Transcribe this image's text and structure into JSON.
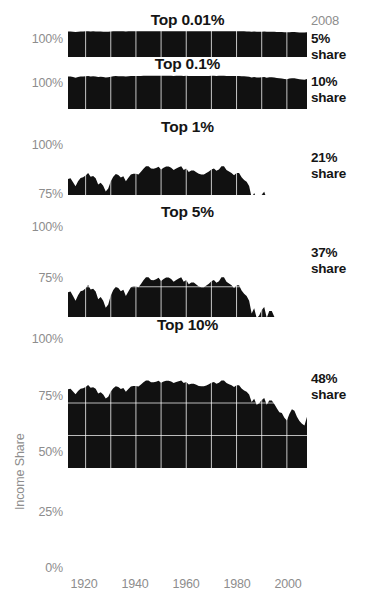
{
  "figure": {
    "y_axis_title": "Income Share",
    "end_year_label": "2008",
    "background_color": "#ffffff",
    "series_color": "#111111",
    "tick_color": "#8d8d8d",
    "gridline_color": "#ffffff"
  },
  "chart_data": {
    "type": "area",
    "title": "Income Share",
    "xlabel": "",
    "ylabel": "Income Share",
    "grid": true,
    "legend_position": "none",
    "x": [
      1913,
      1914,
      1915,
      1916,
      1917,
      1918,
      1919,
      1920,
      1921,
      1922,
      1923,
      1924,
      1925,
      1926,
      1927,
      1928,
      1929,
      1930,
      1931,
      1932,
      1933,
      1934,
      1935,
      1936,
      1937,
      1938,
      1939,
      1940,
      1941,
      1942,
      1943,
      1944,
      1945,
      1946,
      1947,
      1948,
      1949,
      1950,
      1951,
      1952,
      1953,
      1954,
      1955,
      1956,
      1957,
      1958,
      1959,
      1960,
      1961,
      1962,
      1963,
      1964,
      1965,
      1966,
      1967,
      1968,
      1969,
      1970,
      1971,
      1972,
      1973,
      1974,
      1975,
      1976,
      1977,
      1978,
      1979,
      1980,
      1981,
      1982,
      1983,
      1984,
      1985,
      1986,
      1987,
      1988,
      1989,
      1990,
      1991,
      1992,
      1993,
      1994,
      1995,
      1996,
      1997,
      1998,
      1999,
      2000,
      2001,
      2002,
      2003,
      2004,
      2005,
      2006,
      2007,
      2008
    ],
    "xlim": [
      1913,
      2008
    ],
    "xticks": [
      1920,
      1940,
      1960,
      1980,
      2000
    ],
    "xticklabels": [
      "1920",
      "1940",
      "1960",
      "1980",
      "2000"
    ],
    "panels": [
      {
        "name": "Top 0.01%",
        "title": "Top 0.01%",
        "end_value_label": "5%",
        "end_value_sublabel": "share",
        "ylim": [
          0,
          100
        ],
        "yticks": [
          100
        ],
        "yticklabels": [
          "100%"
        ],
        "values": [
          98.2,
          98.4,
          97.3,
          96.0,
          97.2,
          98.1,
          98.4,
          98.6,
          98.9,
          98.4,
          98.6,
          98.4,
          97.6,
          97.8,
          97.5,
          96.8,
          97.2,
          98.0,
          98.6,
          98.9,
          98.8,
          98.6,
          98.7,
          98.3,
          98.6,
          98.9,
          98.9,
          98.9,
          98.9,
          99.1,
          99.3,
          99.4,
          99.4,
          99.3,
          99.3,
          99.3,
          99.4,
          99.2,
          99.3,
          99.4,
          99.4,
          99.3,
          99.2,
          99.3,
          99.4,
          99.4,
          99.2,
          99.3,
          99.1,
          99.2,
          99.2,
          99.1,
          99.0,
          99.0,
          99.0,
          99.1,
          99.2,
          99.3,
          99.3,
          99.2,
          99.3,
          99.4,
          99.4,
          99.2,
          99.1,
          99.0,
          98.9,
          99.0,
          99.0,
          98.8,
          98.6,
          98.5,
          98.2,
          97.2,
          97.6,
          96.9,
          97.1,
          97.5,
          97.7,
          96.9,
          97.4,
          97.4,
          97.0,
          96.4,
          95.9,
          95.8,
          95.2,
          94.8,
          95.6,
          96.2,
          96.0,
          95.2,
          94.6,
          94.2,
          94.0,
          95.0
        ]
      },
      {
        "name": "Top 0.1%",
        "title": "Top 0.1%",
        "end_value_label": "10%",
        "end_value_sublabel": "share",
        "ylim": [
          0,
          100
        ],
        "yticks": [
          100
        ],
        "yticklabels": [
          "100%"
        ],
        "values": [
          95.6,
          95.8,
          94.0,
          92.2,
          94.1,
          95.3,
          95.7,
          96.2,
          96.9,
          95.9,
          96.2,
          95.8,
          94.2,
          94.6,
          93.9,
          92.3,
          93.2,
          95.0,
          96.2,
          96.8,
          96.6,
          96.1,
          96.4,
          95.3,
          96.1,
          96.8,
          96.9,
          96.9,
          96.8,
          97.2,
          97.6,
          97.9,
          97.9,
          97.6,
          97.6,
          97.7,
          97.9,
          97.5,
          97.7,
          97.9,
          97.9,
          97.7,
          97.4,
          97.6,
          97.8,
          97.9,
          97.4,
          97.6,
          97.1,
          97.3,
          97.3,
          97.1,
          96.9,
          96.8,
          96.8,
          97.0,
          97.2,
          97.5,
          97.6,
          97.3,
          97.5,
          97.9,
          97.9,
          97.4,
          97.2,
          97.0,
          96.7,
          97.0,
          97.0,
          96.4,
          96.0,
          95.7,
          95.0,
          93.0,
          93.8,
          92.3,
          92.7,
          93.5,
          94.0,
          92.2,
          93.3,
          93.3,
          92.4,
          91.2,
          90.1,
          89.9,
          88.6,
          87.8,
          89.5,
          90.8,
          90.4,
          88.8,
          87.5,
          86.7,
          86.2,
          88.5
        ]
      },
      {
        "name": "Top 1%",
        "title": "Top 1%",
        "end_value_label": "21%",
        "end_value_sublabel": "share",
        "ylim": [
          75,
          100
        ],
        "yticks": [
          75,
          100
        ],
        "yticklabels": [
          "75%",
          "100%"
        ],
        "values": [
          82.0,
          82.3,
          80.6,
          78.8,
          81.0,
          82.5,
          82.8,
          83.5,
          84.6,
          83.0,
          83.3,
          82.4,
          79.6,
          80.4,
          79.1,
          76.5,
          77.8,
          81.0,
          83.0,
          84.2,
          83.8,
          82.7,
          83.2,
          81.0,
          82.6,
          84.0,
          84.3,
          84.3,
          84.0,
          85.2,
          86.5,
          87.6,
          87.6,
          86.6,
          86.5,
          86.8,
          87.4,
          86.2,
          86.9,
          87.5,
          87.5,
          86.9,
          86.0,
          86.6,
          87.2,
          87.6,
          86.0,
          86.6,
          85.1,
          85.7,
          85.7,
          85.0,
          84.3,
          84.0,
          84.0,
          84.6,
          85.3,
          86.2,
          86.6,
          85.6,
          86.2,
          87.6,
          87.6,
          86.0,
          85.3,
          84.7,
          83.7,
          84.7,
          84.7,
          82.8,
          81.6,
          80.8,
          79.0,
          73.8,
          75.9,
          72.0,
          73.0,
          75.2,
          76.4,
          72.0,
          74.8,
          74.8,
          72.5,
          69.5,
          66.9,
          66.4,
          63.3,
          61.5,
          65.9,
          69.0,
          68.0,
          64.1,
          61.2,
          59.5,
          58.2,
          64.0
        ]
      },
      {
        "name": "Top 5%",
        "title": "Top 5%",
        "end_value_label": "37%",
        "end_value_sublabel": "share",
        "ylim": [
          62,
          102
        ],
        "yticks": [
          75,
          100
        ],
        "yticklabels": [
          "75%",
          "100%"
        ],
        "values": [
          72.6,
          73.0,
          71.0,
          69.0,
          71.4,
          73.1,
          73.4,
          74.4,
          75.8,
          73.8,
          74.2,
          73.0,
          69.6,
          70.6,
          69.0,
          66.0,
          67.4,
          71.2,
          73.6,
          75.0,
          74.5,
          73.1,
          73.7,
          71.0,
          73.0,
          74.8,
          75.2,
          75.2,
          74.8,
          76.2,
          77.8,
          79.1,
          79.1,
          77.9,
          77.8,
          78.2,
          78.9,
          77.5,
          78.3,
          79.0,
          79.0,
          78.3,
          77.2,
          77.9,
          78.6,
          79.1,
          77.2,
          77.9,
          76.1,
          76.8,
          76.8,
          76.0,
          75.1,
          74.8,
          74.8,
          75.5,
          76.3,
          77.4,
          77.9,
          76.7,
          77.4,
          79.1,
          79.1,
          77.2,
          76.4,
          75.7,
          74.5,
          75.7,
          75.7,
          73.4,
          72.0,
          71.0,
          69.0,
          63.5,
          65.8,
          61.5,
          62.6,
          65.0,
          66.3,
          61.6,
          64.6,
          64.6,
          62.1,
          58.9,
          56.1,
          55.6,
          52.3,
          50.4,
          55.0,
          58.3,
          57.2,
          53.1,
          50.0,
          48.2,
          46.8,
          53.0
        ]
      },
      {
        "name": "Top 10%",
        "title": "Top 10%",
        "end_value_label": "48%",
        "end_value_sublabel": "share",
        "ylim": [
          0,
          100
        ],
        "yticks": [
          0,
          25,
          50,
          75,
          100
        ],
        "yticklabels": [
          "0%",
          "25%",
          "50%",
          "75%",
          "100%"
        ],
        "values": [
          60.5,
          60.9,
          58.8,
          56.7,
          59.2,
          60.9,
          61.3,
          62.3,
          63.8,
          61.7,
          62.1,
          60.9,
          57.3,
          58.3,
          56.6,
          53.4,
          54.9,
          58.8,
          61.4,
          62.9,
          62.3,
          60.8,
          61.5,
          58.6,
          60.8,
          62.7,
          63.1,
          63.1,
          62.6,
          64.2,
          65.9,
          67.3,
          67.3,
          66.0,
          65.9,
          66.3,
          67.1,
          65.6,
          66.5,
          67.2,
          67.2,
          66.5,
          65.3,
          66.1,
          66.8,
          67.3,
          65.3,
          66.1,
          64.2,
          64.9,
          64.9,
          64.0,
          63.1,
          62.8,
          62.8,
          63.5,
          64.4,
          65.6,
          66.1,
          64.8,
          65.6,
          67.3,
          67.3,
          65.3,
          64.4,
          63.7,
          62.4,
          63.7,
          63.7,
          61.2,
          59.7,
          58.7,
          56.5,
          50.7,
          53.2,
          48.6,
          49.8,
          52.4,
          53.8,
          48.7,
          52.0,
          52.0,
          49.3,
          45.9,
          42.8,
          42.3,
          38.7,
          36.6,
          41.6,
          45.2,
          44.0,
          39.5,
          36.1,
          34.1,
          32.6,
          39.4
        ]
      }
    ]
  }
}
